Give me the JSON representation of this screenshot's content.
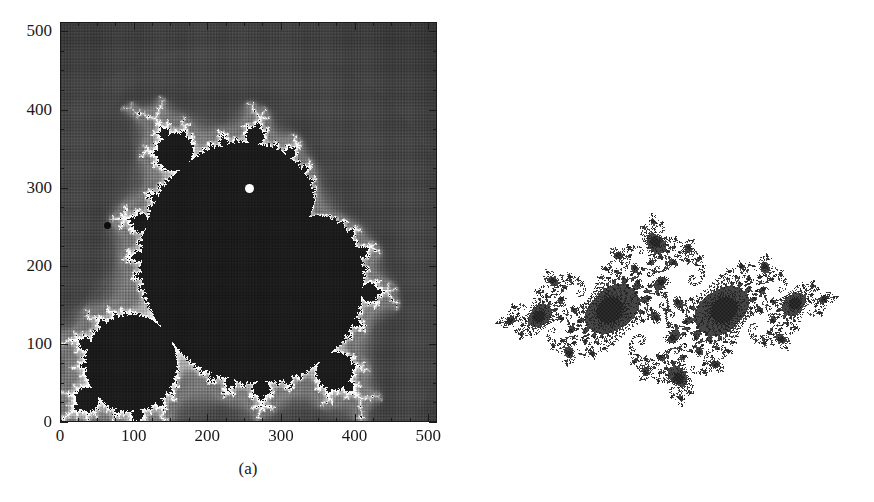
{
  "figure": {
    "background_color": "#ffffff",
    "ink_color": "#1a1a1a",
    "width": 874,
    "height": 502
  },
  "panel_a": {
    "caption": "(a)",
    "marker_white_label": "white-dot-marker",
    "marker_black_label": "black-dot-marker"
  },
  "panel_b": {
    "caption": "(b)"
  },
  "chart_data": [
    {
      "panel": "(a)",
      "type": "heatmap",
      "title": "",
      "xlabel": "",
      "ylabel": "",
      "xlim": [
        0,
        512
      ],
      "ylim": [
        0,
        512
      ],
      "grid": false,
      "legend": "none",
      "xticks": [
        0,
        100,
        200,
        300,
        400,
        500
      ],
      "yticks": [
        0,
        100,
        200,
        300,
        400,
        500
      ],
      "xtick_labels": [
        "0",
        "100",
        "200",
        "300",
        "400",
        "500"
      ],
      "ytick_labels": [
        "0",
        "100",
        "200",
        "300",
        "400",
        "500"
      ],
      "minor_tick_interval": 25,
      "colormap": "grayscale-escape-time",
      "grid_size": [
        512,
        512
      ],
      "field": "mandelbrot-escape-time",
      "complex_plane": {
        "re_min": -2.05,
        "re_max": 0.6,
        "im_min": -1.32,
        "im_max": 1.32,
        "max_iterations": 60
      },
      "orientation": "transposed-axes (pixel index grid, set rotated 90 deg)",
      "annotations": [
        {
          "name": "white-dot",
          "x": 256,
          "y": 300,
          "color": "#ffffff",
          "radius_px": 4.5
        },
        {
          "name": "black-dot",
          "x": 63,
          "y": 253,
          "color": "#0d0d0d",
          "radius_px": 3.5
        }
      ]
    },
    {
      "panel": "(b)",
      "type": "scatter",
      "title": "",
      "xlabel": "",
      "ylabel": "",
      "grid": false,
      "legend": "none",
      "axes_visible": false,
      "field": "julia-set-dendrite",
      "fill_color": "#262626",
      "complex_plane": {
        "re_min": -1.75,
        "re_max": 1.75,
        "im_min": -1.05,
        "im_max": 1.05,
        "c_re": -0.74543,
        "c_im": 0.11301,
        "max_iterations": 220
      }
    }
  ],
  "axes_a": {
    "x_ticks": [
      {
        "value": 0,
        "label": "0"
      },
      {
        "value": 100,
        "label": "100"
      },
      {
        "value": 200,
        "label": "200"
      },
      {
        "value": 300,
        "label": "300"
      },
      {
        "value": 400,
        "label": "400"
      },
      {
        "value": 500,
        "label": "500"
      }
    ],
    "y_ticks": [
      {
        "value": 0,
        "label": "0"
      },
      {
        "value": 100,
        "label": "100"
      },
      {
        "value": 200,
        "label": "200"
      },
      {
        "value": 300,
        "label": "300"
      },
      {
        "value": 400,
        "label": "400"
      },
      {
        "value": 500,
        "label": "500"
      }
    ]
  }
}
